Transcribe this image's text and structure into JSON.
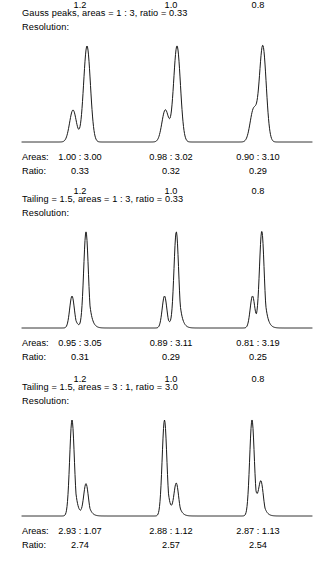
{
  "figure": {
    "width": 323,
    "height": 567,
    "background": "#ffffff",
    "trace_color": "#1a1a1a",
    "text_color": "#000000"
  },
  "labels": {
    "resolution_key": "Resolution:",
    "areas_key": "Areas:",
    "ratio_key": "Ratio:"
  },
  "panels": [
    {
      "title": "Gauss peaks, areas = 1 : 3, ratio = 0.33",
      "peak_shape": "gaussian",
      "tailing": 1.0,
      "nominal_areas": "1 : 3",
      "nominal_ratio": "0.33",
      "groups": [
        {
          "resolution": "1.2",
          "areas": "1.00 : 3.00",
          "ratio": "0.33",
          "center_x": 80,
          "peaks": [
            {
              "center": 73.0,
              "sigma": 3.4,
              "area": 1.0
            },
            {
              "center": 87.0,
              "sigma": 3.4,
              "area": 3.0
            }
          ]
        },
        {
          "resolution": "1.0",
          "areas": "0.98 : 3.02",
          "ratio": "0.32",
          "center_x": 171,
          "peaks": [
            {
              "center": 165.3,
              "sigma": 3.4,
              "area": 1.0
            },
            {
              "center": 177.0,
              "sigma": 3.4,
              "area": 3.0
            }
          ]
        },
        {
          "resolution": "0.8",
          "areas": "0.90 : 3.10",
          "ratio": "0.29",
          "center_x": 258,
          "peaks": [
            {
              "center": 253.5,
              "sigma": 3.4,
              "area": 1.0
            },
            {
              "center": 262.8,
              "sigma": 3.4,
              "area": 3.0
            }
          ]
        }
      ]
    },
    {
      "title": "Tailing = 1.5, areas = 1 : 3, ratio = 0.33",
      "peak_shape": "tailing",
      "tailing": 1.5,
      "nominal_areas": "1 : 3",
      "nominal_ratio": "0.33",
      "groups": [
        {
          "resolution": "1.2",
          "areas": "0.95 : 3.05",
          "ratio": "0.31",
          "center_x": 80,
          "peaks": [
            {
              "center": 72.0,
              "sigma": 2.9,
              "area": 1.0
            },
            {
              "center": 86.0,
              "sigma": 2.9,
              "area": 3.0
            }
          ]
        },
        {
          "resolution": "1.0",
          "areas": "0.89 : 3.11",
          "ratio": "0.29",
          "center_x": 171,
          "peaks": [
            {
              "center": 164.5,
              "sigma": 2.9,
              "area": 1.0
            },
            {
              "center": 176.3,
              "sigma": 2.9,
              "area": 3.0
            }
          ]
        },
        {
          "resolution": "0.8",
          "areas": "0.81 : 3.19",
          "ratio": "0.25",
          "center_x": 258,
          "peaks": [
            {
              "center": 252.5,
              "sigma": 2.9,
              "area": 1.0
            },
            {
              "center": 261.8,
              "sigma": 2.9,
              "area": 3.0
            }
          ]
        }
      ]
    },
    {
      "title": "Tailing = 1.5, areas = 3 : 1, ratio = 3.0",
      "peak_shape": "tailing",
      "tailing": 1.5,
      "nominal_areas": "3 : 1",
      "nominal_ratio": "3.0",
      "groups": [
        {
          "resolution": "1.2",
          "areas": "2.93 : 1.07",
          "ratio": "2.74",
          "center_x": 80,
          "peaks": [
            {
              "center": 72.0,
              "sigma": 2.9,
              "area": 3.0
            },
            {
              "center": 86.0,
              "sigma": 2.9,
              "area": 1.0
            }
          ]
        },
        {
          "resolution": "1.0",
          "areas": "2.88 : 1.12",
          "ratio": "2.57",
          "center_x": 171,
          "peaks": [
            {
              "center": 164.5,
              "sigma": 2.9,
              "area": 3.0
            },
            {
              "center": 176.3,
              "sigma": 2.9,
              "area": 1.0
            }
          ]
        },
        {
          "resolution": "0.8",
          "areas": "2.87 : 1.13",
          "ratio": "2.54",
          "center_x": 258,
          "peaks": [
            {
              "center": 252.0,
              "sigma": 2.9,
              "area": 3.0
            },
            {
              "center": 261.0,
              "sigma": 2.9,
              "area": 1.0
            }
          ]
        }
      ]
    }
  ],
  "chart_data": {
    "type": "line",
    "xlabel": "",
    "ylabel": "",
    "grid": false,
    "legend": null,
    "panels": [
      {
        "name": "Gauss peaks, areas = 1 : 3, ratio = 0.33",
        "series": [
          {
            "name": "Rs = 1.2",
            "measured_areas": [
              1.0,
              3.0
            ],
            "measured_ratio": 0.33
          },
          {
            "name": "Rs = 1.0",
            "measured_areas": [
              0.98,
              3.02
            ],
            "measured_ratio": 0.32
          },
          {
            "name": "Rs = 0.8",
            "measured_areas": [
              0.9,
              3.1
            ],
            "measured_ratio": 0.29
          }
        ]
      },
      {
        "name": "Tailing = 1.5, areas = 1 : 3, ratio = 0.33",
        "series": [
          {
            "name": "Rs = 1.2",
            "measured_areas": [
              0.95,
              3.05
            ],
            "measured_ratio": 0.31
          },
          {
            "name": "Rs = 1.0",
            "measured_areas": [
              0.89,
              3.11
            ],
            "measured_ratio": 0.29
          },
          {
            "name": "Rs = 0.8",
            "measured_areas": [
              0.81,
              3.19
            ],
            "measured_ratio": 0.25
          }
        ]
      },
      {
        "name": "Tailing = 1.5, areas = 3 : 1, ratio = 3.0",
        "series": [
          {
            "name": "Rs = 1.2",
            "measured_areas": [
              2.93,
              1.07
            ],
            "measured_ratio": 2.74
          },
          {
            "name": "Rs = 1.0",
            "measured_areas": [
              2.88,
              1.12
            ],
            "measured_ratio": 2.57
          },
          {
            "name": "Rs = 0.8",
            "measured_areas": [
              2.87,
              1.13
            ],
            "measured_ratio": 2.54
          }
        ]
      }
    ]
  }
}
